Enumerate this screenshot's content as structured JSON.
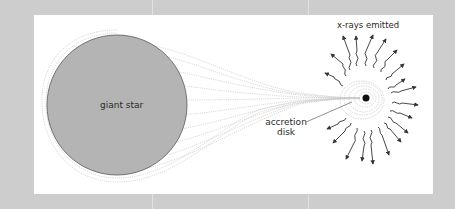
{
  "figure": {
    "type": "diagram",
    "colors": {
      "background": "#cdcdcd",
      "panel": "#ffffff",
      "star_fill": "#b4b4b4",
      "star_outline": "#555555",
      "stream": "#c8c8c8",
      "ray": "#333333",
      "compact_object": "#111111"
    }
  },
  "labels": {
    "giant_star": "giant star",
    "xrays": "x-rays emitted",
    "accretion_disk_line1": "accretion",
    "accretion_disk_line2": "disk"
  },
  "geometry": {
    "star": {
      "cx": 117,
      "cy": 105,
      "r": 70
    },
    "compact_object": {
      "cx": 366,
      "cy": 98,
      "r": 3.5
    },
    "ray_count": 20
  }
}
